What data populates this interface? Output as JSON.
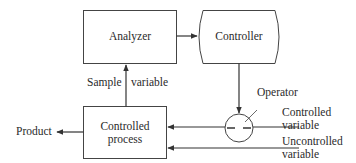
{
  "diagram": {
    "nodes": {
      "analyzer": {
        "label": "Analyzer"
      },
      "controller": {
        "label": "Controller"
      },
      "process": {
        "line1": "Controlled",
        "line2": "process"
      },
      "operator": {
        "label": "Operator"
      }
    },
    "labels": {
      "sample": "Sample",
      "sample_variable": "variable",
      "product": "Product",
      "controlled_var_1": "Controlled",
      "controlled_var_2": "variable",
      "uncontrolled_var_1": "Uncontrolled",
      "uncontrolled_var_2": "variable"
    },
    "edges": [
      {
        "from": "analyzer",
        "to": "controller"
      },
      {
        "from": "controller",
        "to": "operator"
      },
      {
        "from": "operator",
        "to": "process",
        "label": "Controlled variable"
      },
      {
        "from": "uncontrolled-input",
        "to": "process",
        "label": "Uncontrolled variable"
      },
      {
        "from": "process",
        "to": "analyzer",
        "label": "Sample variable"
      },
      {
        "from": "process",
        "to": "product",
        "label": "Product"
      }
    ],
    "colors": {
      "stroke": "#3a3a3a",
      "text": "#2a2a2a",
      "background": "#ffffff"
    }
  }
}
